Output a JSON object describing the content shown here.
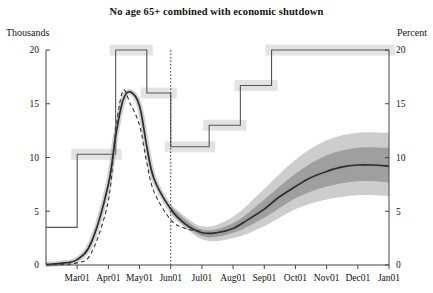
{
  "title": "No age 65+ combined with economic shutdown",
  "axis": {
    "left_label": "Thousands",
    "right_label": "Percent",
    "left_ticks": [
      "0",
      "5",
      "10",
      "15",
      "20"
    ],
    "right_ticks": [
      "0",
      "5",
      "10",
      "15",
      "20"
    ],
    "x_ticks": [
      "Mar01",
      "Apr01",
      "May01",
      "Jun01",
      "Jul01",
      "Aug01",
      "Sep01",
      "Oct01",
      "Nov01",
      "Dec01",
      "Jan01"
    ]
  },
  "colors": {
    "line": "#2b2b2b",
    "step": "#555555",
    "band_inner": "#9a9a9a",
    "band_outer": "#c4c4c4",
    "step_band": "#cccccc",
    "axis": "#444444",
    "dashed": "#333333"
  },
  "chart_data": {
    "type": "line",
    "title": "No age 65+ combined with economic shutdown",
    "xlabel": "",
    "ylabel": "Thousands",
    "ylabel_right": "Percent",
    "ylim": [
      0,
      20
    ],
    "ylim_right": [
      0,
      20
    ],
    "grid": false,
    "legend": "none",
    "x": [
      "Feb01",
      "Mar01",
      "Apr01",
      "May01",
      "Jun01",
      "Jul01",
      "Aug01",
      "Sep01",
      "Oct01",
      "Nov01",
      "Dec01",
      "Jan01"
    ],
    "annotations": [
      {
        "type": "vline",
        "x": "Jun01",
        "style": "dotted",
        "label": "forecast start"
      }
    ],
    "series": [
      {
        "name": "Deaths (thousands), central projection",
        "axis": "left",
        "style": "solid",
        "x": [
          "Feb01",
          "Feb15",
          "Mar01",
          "Mar15",
          "Apr01",
          "Apr08",
          "Apr15",
          "Apr22",
          "May01",
          "May08",
          "May15",
          "Jun01",
          "Jun15",
          "Jul01",
          "Jul15",
          "Aug01",
          "Aug15",
          "Sep01",
          "Sep15",
          "Oct01",
          "Oct15",
          "Nov01",
          "Nov15",
          "Dec01",
          "Dec15",
          "Jan01"
        ],
        "values": [
          0.05,
          0.15,
          0.5,
          2.2,
          7.5,
          12.0,
          15.3,
          16.1,
          14.8,
          11.0,
          8.0,
          5.2,
          3.8,
          3.0,
          3.0,
          3.4,
          4.2,
          5.2,
          6.3,
          7.3,
          8.1,
          8.7,
          9.1,
          9.3,
          9.3,
          9.2
        ]
      },
      {
        "name": "Deaths (thousands), alternative scenario",
        "axis": "left",
        "style": "dashed",
        "x": [
          "Feb01",
          "Mar01",
          "Mar15",
          "Apr01",
          "Apr08",
          "Apr15",
          "Apr22",
          "May01",
          "May08",
          "May15",
          "Jun01",
          "Jun15",
          "Jul01"
        ],
        "values": [
          0.02,
          0.2,
          1.2,
          6.0,
          12.5,
          16.2,
          15.0,
          13.0,
          9.5,
          6.8,
          4.2,
          3.4,
          3.1
        ]
      },
      {
        "name": "Deaths 68% uncertainty band (inner)",
        "axis": "left",
        "style": "band",
        "x": [
          "Jun01",
          "Jul01",
          "Aug01",
          "Sep01",
          "Oct01",
          "Nov01",
          "Dec01",
          "Jan01"
        ],
        "lower": [
          5.0,
          2.7,
          3.0,
          4.4,
          6.2,
          7.3,
          7.8,
          7.7
        ],
        "upper": [
          5.4,
          3.3,
          3.9,
          6.1,
          8.5,
          10.2,
          10.9,
          10.9
        ]
      },
      {
        "name": "Deaths 90% uncertainty band (outer)",
        "axis": "left",
        "style": "band",
        "x": [
          "Jun01",
          "Jul01",
          "Aug01",
          "Sep01",
          "Oct01",
          "Nov01",
          "Dec01",
          "Jan01"
        ],
        "lower": [
          4.8,
          2.4,
          2.5,
          3.6,
          5.2,
          6.1,
          6.5,
          6.4
        ],
        "upper": [
          5.6,
          3.6,
          4.5,
          7.1,
          9.8,
          11.6,
          12.3,
          12.3
        ]
      },
      {
        "name": "Infection rate (percent), step path",
        "axis": "right",
        "style": "step",
        "steps": [
          {
            "from": "Feb01",
            "to": "Mar01",
            "value": 3.5
          },
          {
            "from": "Mar01",
            "to": "Apr08",
            "value": 10.3
          },
          {
            "from": "Apr08",
            "to": "May08",
            "value": 20.0
          },
          {
            "from": "May08",
            "to": "Jun01",
            "value": 16.0
          },
          {
            "from": "Jun01",
            "to": "Jul08",
            "value": 11.0
          },
          {
            "from": "Jul08",
            "to": "Aug08",
            "value": 13.0
          },
          {
            "from": "Aug08",
            "to": "Sep08",
            "value": 16.7
          },
          {
            "from": "Sep08",
            "to": "Jan01",
            "value": 20.0
          }
        ]
      }
    ]
  }
}
